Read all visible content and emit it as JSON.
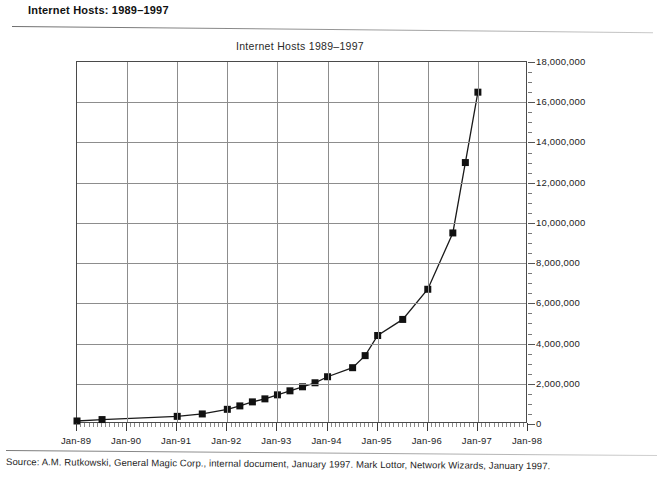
{
  "header": {
    "title": "Internet Hosts: 1989–1997"
  },
  "source": {
    "text": "Source: A.M. Rutkowski, General Magic Corp., internal document, January 1997. Mark Lottor, Network Wizards, January 1997."
  },
  "chart_data": {
    "type": "line",
    "title": "Internet Hosts 1989–1997",
    "xlabel": "",
    "ylabel": "",
    "grid": true,
    "legend": false,
    "marker": "filled-square",
    "line_color": "#1a1a1a",
    "marker_color": "#111111",
    "grid_color": "#8d8d8d",
    "xlim": [
      "Jan-89",
      "Jan-98"
    ],
    "ylim": [
      0,
      18000000
    ],
    "ytick_step": 2000000,
    "xtick_labels": [
      "Jan-89",
      "Jan-90",
      "Jan-91",
      "Jan-92",
      "Jan-93",
      "Jan-94",
      "Jan-95",
      "Jan-96",
      "Jan-97",
      "Jan-98"
    ],
    "ytick_labels": [
      "0",
      "2,000,000",
      "4,000,000",
      "6,000,000",
      "8,000,000",
      "10,000,000",
      "12,000,000",
      "14,000,000",
      "16,000,000",
      "18,000,000"
    ],
    "ytick_values": [
      0,
      2000000,
      4000000,
      6000000,
      8000000,
      10000000,
      12000000,
      14000000,
      16000000,
      18000000
    ],
    "x": [
      "Jan-89",
      "Jul-89",
      "Jan-90",
      "Jul-90",
      "Jan-91",
      "Jul-91",
      "Jan-92",
      "Jul-92",
      "Jan-93",
      "Apr-93",
      "Jul-93",
      "Oct-93",
      "Jan-94",
      "Apr-94",
      "Jul-94",
      "Oct-94",
      "Jan-95",
      "Jul-95",
      "Jan-96",
      "Jul-96",
      "Jan-97"
    ],
    "x_frac": [
      0.0,
      0.5,
      1.0,
      1.5,
      2.0,
      2.5,
      3.0,
      3.3,
      3.6,
      3.9,
      4.2,
      4.5,
      4.8,
      5.1,
      5.4,
      5.7,
      6.0,
      6.6,
      7.2,
      7.8,
      8.4
    ],
    "values": [
      130000,
      180000,
      320000,
      380000,
      560000,
      620000,
      730000,
      890000,
      1100000,
      1350000,
      1600000,
      1800000,
      2050000,
      2250000,
      2500000,
      2900000,
      3400000,
      4400000,
      5200000,
      6700000,
      9500000
    ],
    "series": [
      {
        "name": "Internet hosts",
        "points": [
          {
            "x": "Jan-89",
            "y": 150000
          },
          {
            "x": "Jul-89",
            "y": 220000
          },
          {
            "x": "Jan-91",
            "y": 380000
          },
          {
            "x": "Jul-91",
            "y": 500000
          },
          {
            "x": "Jan-92",
            "y": 730000
          },
          {
            "x": "Apr-92",
            "y": 900000
          },
          {
            "x": "Jul-92",
            "y": 1100000
          },
          {
            "x": "Oct-92",
            "y": 1250000
          },
          {
            "x": "Jan-93",
            "y": 1450000
          },
          {
            "x": "Apr-93",
            "y": 1650000
          },
          {
            "x": "Jul-93",
            "y": 1850000
          },
          {
            "x": "Oct-93",
            "y": 2050000
          },
          {
            "x": "Jan-94",
            "y": 2350000
          },
          {
            "x": "Jul-94",
            "y": 2800000
          },
          {
            "x": "Oct-94",
            "y": 3400000
          },
          {
            "x": "Jan-95",
            "y": 4400000
          },
          {
            "x": "Jul-95",
            "y": 5200000
          },
          {
            "x": "Jan-96",
            "y": 6700000
          },
          {
            "x": "Jul-96",
            "y": 9500000
          },
          {
            "x": "Oct-96",
            "y": 13000000
          },
          {
            "x": "Jan-97",
            "y": 16500000
          }
        ]
      }
    ],
    "annotations": []
  }
}
